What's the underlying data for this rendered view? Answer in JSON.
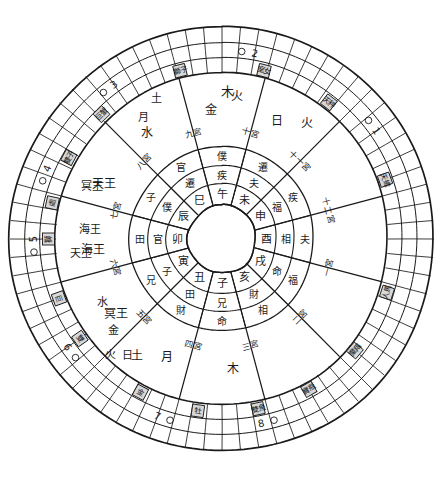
{
  "document": {
    "title": "手繪命盤圓圖",
    "type": "astrological-wheel",
    "background_color": "#ffffff",
    "ink_color": "#1a1a1a"
  },
  "geometry": {
    "center_x": 222,
    "center_y": 239,
    "radii": {
      "outer_rim": 212,
      "degree_ring_outer": 212,
      "degree_ring_mid1": 196,
      "degree_ring_mid2": 181,
      "degree_ring_inner": 166,
      "sector_ring": 166,
      "palace_outer": 92,
      "palace_mid": 73,
      "branch_outer": 55,
      "core_circle": 34
    },
    "degree_ticks": 72,
    "sectors": 12
  },
  "outer_ring": {
    "label": "黃道刻度環",
    "house_numbers": [
      "1",
      "2",
      "3",
      "4",
      "5",
      "6",
      "7",
      "8"
    ],
    "house_number_positions_deg": [
      55,
      10,
      -35,
      -68,
      -90,
      -125,
      -160,
      168
    ],
    "sign_boxes": [
      {
        "sign": "獅",
        "angle": -90
      },
      {
        "sign": "處",
        "angle": -78
      },
      {
        "sign": "巨",
        "angle": -110
      },
      {
        "sign": "雙",
        "angle": -125
      },
      {
        "sign": "金",
        "angle": -152
      },
      {
        "sign": "牡",
        "angle": -172
      },
      {
        "sign": "雙魚",
        "angle": 168
      },
      {
        "sign": "寶瓶",
        "angle": 150
      },
      {
        "sign": "魔羯",
        "angle": 130
      },
      {
        "sign": "人馬",
        "angle": 108
      },
      {
        "sign": "天蠍",
        "angle": 70
      },
      {
        "sign": "天秤",
        "angle": 38
      },
      {
        "sign": "室女",
        "angle": 14
      },
      {
        "sign": "獅子",
        "angle": -14
      },
      {
        "sign": "巨蟹",
        "angle": -44
      },
      {
        "sign": "雙子",
        "angle": -62
      }
    ]
  },
  "sectors": [
    {
      "index": 1,
      "planets": [
        "木"
      ],
      "note": "木星"
    },
    {
      "index": 2,
      "planets": [
        "月",
        "土"
      ],
      "note": "月 土星"
    },
    {
      "index": 3,
      "planets": [
        "冥王"
      ],
      "note": "冥王星"
    },
    {
      "index": 4,
      "planets": [
        "海王"
      ],
      "note": "海王星"
    },
    {
      "index": 5,
      "planets": [
        "天王"
      ],
      "note": "天王星"
    },
    {
      "index": 6,
      "planets": [
        "水"
      ],
      "note": "水星"
    },
    {
      "index": 7,
      "planets": [
        "金",
        "火"
      ],
      "note": "金星 火星"
    },
    {
      "index": 8,
      "planets": [
        "日",
        "火"
      ],
      "note": "日 火"
    },
    {
      "index": 9,
      "planets": [],
      "note": ""
    },
    {
      "index": 10,
      "planets": [],
      "note": ""
    },
    {
      "index": 11,
      "planets": [],
      "note": ""
    },
    {
      "index": 12,
      "planets": [],
      "note": ""
    }
  ],
  "palace_numbers": [
    "一宮",
    "二宮",
    "三宮",
    "四宮",
    "五宮",
    "六宮",
    "七宮",
    "八宮",
    "九宮",
    "十宮",
    "十一宮",
    "十二宮"
  ],
  "palace_names": [
    "命",
    "財",
    "兄",
    "田",
    "子",
    "官",
    "僕",
    "遷",
    "疾",
    "夫",
    "福",
    "相"
  ],
  "earthly_branches": [
    "子",
    "丑",
    "寅",
    "卯",
    "辰",
    "巳",
    "午",
    "未",
    "申",
    "酉",
    "戌",
    "亥"
  ],
  "inner_ring_marks": [
    "兄",
    "田",
    "子",
    "官",
    "僕",
    "遷",
    "疾",
    "夫",
    "福",
    "相",
    "命",
    "財"
  ],
  "center": {
    "fill": "#ffffff",
    "label": ""
  },
  "colors": {
    "ink": "#1a1a1a",
    "paper": "#ffffff",
    "faint": "#555555"
  }
}
